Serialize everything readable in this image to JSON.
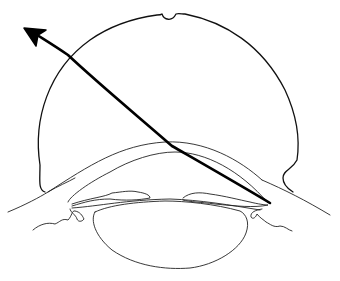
{
  "diagram": {
    "title": "",
    "labels": [],
    "elements": [
      {
        "name": "contact-lens",
        "shape": "dome with notch at top and flared base"
      },
      {
        "name": "cornea",
        "shape": "curved band"
      },
      {
        "name": "iris-left",
        "shape": "irregular band"
      },
      {
        "name": "iris-right",
        "shape": "irregular band"
      },
      {
        "name": "ciliary-body-left",
        "shape": "wavy line"
      },
      {
        "name": "ciliary-body-right",
        "shape": "wavy line"
      },
      {
        "name": "crystalline-lens",
        "shape": "ellipse"
      },
      {
        "name": "sclera-line",
        "shape": "diagonal line"
      },
      {
        "name": "light-ray",
        "shape": "arrow from angle to upper-left"
      }
    ],
    "colors": {
      "stroke": "#111111",
      "background": "#ffffff"
    }
  }
}
